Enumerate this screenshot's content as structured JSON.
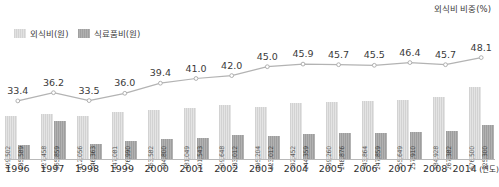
{
  "chart_data": {
    "type": "bar",
    "title": "",
    "xlabel": "연도",
    "ylabel": "",
    "grid": false,
    "legend_position": "top-left",
    "categories": [
      "1996",
      "1997",
      "1998",
      "1999",
      "2000",
      "2001",
      "2002",
      "2003",
      "2004",
      "2005",
      "2006",
      "2007",
      "2008",
      "2014"
    ],
    "series": [
      {
        "name": "외식비(원)",
        "type": "bar",
        "color": "#dcdcdc",
        "axis": "left",
        "values": [
          409502,
          427458,
          412056,
          447081,
          463582,
          481049,
          509648,
          495204,
          532452,
          539260,
          543864,
          555649,
          584928,
          676500
        ],
        "value_labels": [
          "409,502",
          "427,458",
          "412,056",
          "447,081",
          "463,582",
          "481,049",
          "509,648",
          "495,204",
          "532,452",
          "539,260",
          "543,864",
          "555,649",
          "584,928",
          "676,500"
        ]
      },
      {
        "name": "식료품비(원)",
        "type": "bar",
        "color": "#a9a9a9",
        "axis": "left",
        "values": [
          135589,
          365859,
          146363,
          176990,
          194800,
          201543,
          233012,
          223012,
          244359,
          248876,
          247859,
          257910,
          267382,
          325300
        ],
        "value_labels": [
          "135,589",
          "365,859",
          "146,363",
          "176,990",
          "194,800",
          "201,543",
          "233,012",
          "223,012",
          "244,359",
          "248,876",
          "247,859",
          "257,910",
          "267,382",
          "325,300"
        ]
      },
      {
        "name": "외식비 비중(%)",
        "type": "line",
        "color": "#b3b3b3",
        "axis": "right",
        "values": [
          33.4,
          36.2,
          33.5,
          36.0,
          39.4,
          41.0,
          42.0,
          45.0,
          45.9,
          45.7,
          45.5,
          46.4,
          45.7,
          48.1
        ],
        "value_labels": [
          "33.4",
          "36.2",
          "33.5",
          "36.0",
          "39.4",
          "41.0",
          "42.0",
          "45.0",
          "45.9",
          "45.7",
          "45.5",
          "46.4",
          "45.7",
          "48.1"
        ]
      }
    ],
    "right_axis_title": "외식비 비중(%)",
    "ylim_left": [
      0,
      760000
    ],
    "ylim_right": [
      31.0,
      50.0
    ]
  }
}
